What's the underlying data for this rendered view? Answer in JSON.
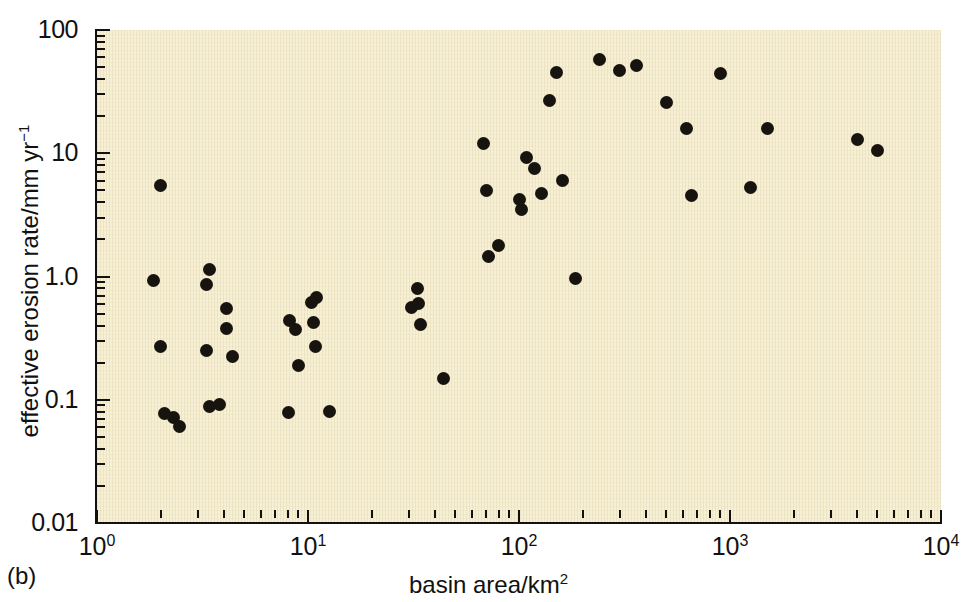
{
  "figure": {
    "panel_letter": "(b)",
    "background_color": "#f7f0d6",
    "marker_color": "#17140f",
    "axis_color": "#111111"
  },
  "axes": {
    "x": {
      "title_text": "basin area/km",
      "title_sup": "2",
      "scale": "log10",
      "range": [
        1,
        10000
      ],
      "tick_labels": [
        {
          "base": "10",
          "exp": "0",
          "value": 1
        },
        {
          "base": "10",
          "exp": "1",
          "value": 10
        },
        {
          "base": "10",
          "exp": "2",
          "value": 100
        },
        {
          "base": "10",
          "exp": "3",
          "value": 1000
        },
        {
          "base": "10",
          "exp": "4",
          "value": 10000
        }
      ]
    },
    "y": {
      "title_prefix": "effective erosion rate/mm yr",
      "title_sup": "−1",
      "scale": "log10",
      "range": [
        0.01,
        100
      ],
      "tick_labels": [
        "100",
        "10",
        "1.0",
        "0.1",
        "0.01"
      ],
      "tick_values": [
        100,
        10,
        1.0,
        0.1,
        0.01
      ]
    }
  },
  "chart_data": {
    "type": "scatter",
    "title": "",
    "xlabel": "basin area/km2",
    "ylabel": "effective erosion rate/mm yr-1",
    "xscale": "log",
    "yscale": "log",
    "xlim": [
      1,
      10000
    ],
    "ylim": [
      0.01,
      100
    ],
    "grid": false,
    "legend": null,
    "series": [
      {
        "name": "catchments",
        "marker": "filled-circle",
        "points": [
          [
            2.0,
            5.5
          ],
          [
            1.85,
            0.93
          ],
          [
            2.0,
            0.27
          ],
          [
            2.1,
            0.078
          ],
          [
            2.3,
            0.072
          ],
          [
            2.45,
            0.061
          ],
          [
            3.3,
            0.86
          ],
          [
            3.4,
            1.15
          ],
          [
            3.3,
            0.25
          ],
          [
            3.4,
            0.088
          ],
          [
            3.8,
            0.092
          ],
          [
            4.1,
            0.55
          ],
          [
            4.1,
            0.38
          ],
          [
            4.4,
            0.225
          ],
          [
            8.2,
            0.44
          ],
          [
            8.7,
            0.37
          ],
          [
            9.0,
            0.19
          ],
          [
            8.1,
            0.079
          ],
          [
            10.4,
            0.62
          ],
          [
            11.0,
            0.67
          ],
          [
            10.6,
            0.42
          ],
          [
            10.9,
            0.27
          ],
          [
            12.6,
            0.08
          ],
          [
            31.0,
            0.56
          ],
          [
            33.0,
            0.8
          ],
          [
            33.5,
            0.6
          ],
          [
            34.0,
            0.41
          ],
          [
            44.0,
            0.15
          ],
          [
            68.0,
            12.0
          ],
          [
            70.0,
            5.0
          ],
          [
            72.0,
            1.45
          ],
          [
            80.0,
            1.8
          ],
          [
            100.0,
            4.2
          ],
          [
            103.0,
            3.5
          ],
          [
            108.0,
            9.2
          ],
          [
            118.0,
            7.5
          ],
          [
            128.0,
            4.7
          ],
          [
            140.0,
            27.0
          ],
          [
            150.0,
            45.0
          ],
          [
            160.0,
            6.0
          ],
          [
            185.0,
            0.97
          ],
          [
            240.0,
            58.0
          ],
          [
            300.0,
            47.0
          ],
          [
            360.0,
            52.0
          ],
          [
            500.0,
            26.0
          ],
          [
            620.0,
            16.0
          ],
          [
            660.0,
            4.5
          ],
          [
            900.0,
            44.0
          ],
          [
            1250.0,
            5.3
          ],
          [
            1500.0,
            16.0
          ],
          [
            4000.0,
            13.0
          ],
          [
            5000.0,
            10.5
          ]
        ]
      }
    ]
  }
}
